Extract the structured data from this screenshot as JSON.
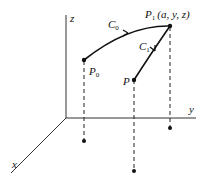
{
  "diagram": {
    "axes": {
      "z_label": "z",
      "y_label": "y",
      "x_label": "x"
    },
    "points": {
      "p0": {
        "label": "P",
        "sub": "0"
      },
      "p1": {
        "label": "P",
        "sub": "1",
        "coords": "(a, y, z)"
      },
      "p": {
        "label": "P"
      }
    },
    "curves": {
      "c0": {
        "label": "C",
        "sub": "0"
      },
      "c1": {
        "label": "C",
        "sub": "1"
      }
    },
    "colors": {
      "line": "#111111",
      "axis": "#333333"
    }
  }
}
